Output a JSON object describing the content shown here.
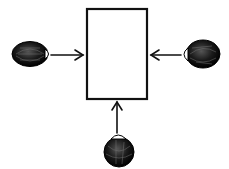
{
  "diagram": {
    "box": {
      "label": "",
      "x": 87,
      "y": 9,
      "width": 60,
      "height": 90,
      "stroke": "#111111",
      "fill": "#ffffff"
    },
    "observers": [
      {
        "id": "left-eye",
        "direction": "right",
        "cx": 30,
        "cy": 54
      },
      {
        "id": "right-eye",
        "direction": "left",
        "cx": 202,
        "cy": 54
      },
      {
        "id": "bottom-eye",
        "direction": "up",
        "cx": 120,
        "cy": 152
      }
    ],
    "arrows": [
      {
        "from": "left-eye",
        "to": "box",
        "x1": 50,
        "y1": 55,
        "x2": 83,
        "y2": 55
      },
      {
        "from": "right-eye",
        "to": "box",
        "x1": 181,
        "y1": 55,
        "x2": 151,
        "y2": 55
      },
      {
        "from": "bottom-eye",
        "to": "box",
        "x1": 117,
        "y1": 134,
        "x2": 117,
        "y2": 102
      }
    ],
    "colors": {
      "ink": "#111111",
      "background": "#ffffff"
    }
  }
}
